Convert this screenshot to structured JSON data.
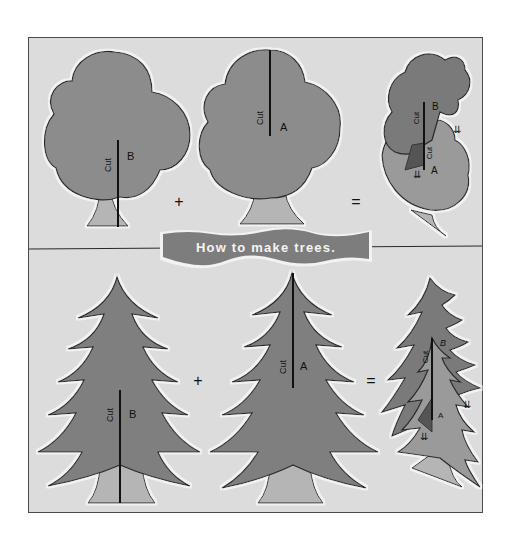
{
  "title": "How to make trees.",
  "colors": {
    "page_background": "#ffffff",
    "panel_background": "#dcdcdc",
    "frame_border": "#4a4a4a",
    "foliage": "#8c8c8c",
    "foliage_dark": "#7a7a7a",
    "trunk": "#b5b5b5",
    "outline": "#2a2a2a",
    "highlight": "#f2f2f2",
    "banner": "#7d7d7d",
    "banner_text": "#f4f4f4",
    "cut_line": "#111111"
  },
  "rows": [
    {
      "name": "deciduous",
      "pieces": [
        {
          "id": "B",
          "cut_label": "Cut",
          "piece_label": "B",
          "cut_from": "bottom"
        },
        {
          "id": "A",
          "cut_label": "Cut",
          "piece_label": "A",
          "cut_from": "top"
        },
        {
          "id": "assembled",
          "labels": [
            "Cut",
            "B",
            "Cut",
            "A"
          ],
          "arrows": [
            "⇊",
            "⇊"
          ]
        }
      ],
      "operators": [
        "+",
        "="
      ]
    },
    {
      "name": "pine",
      "pieces": [
        {
          "id": "B",
          "cut_label": "Cut",
          "piece_label": "B",
          "cut_from": "bottom"
        },
        {
          "id": "A",
          "cut_label": "Cut",
          "piece_label": "A",
          "cut_from": "top"
        },
        {
          "id": "assembled",
          "labels": [
            "Cut",
            "B",
            "A"
          ],
          "arrows": [
            "⇊",
            "⇊"
          ]
        }
      ],
      "operators": [
        "+",
        "="
      ]
    }
  ]
}
